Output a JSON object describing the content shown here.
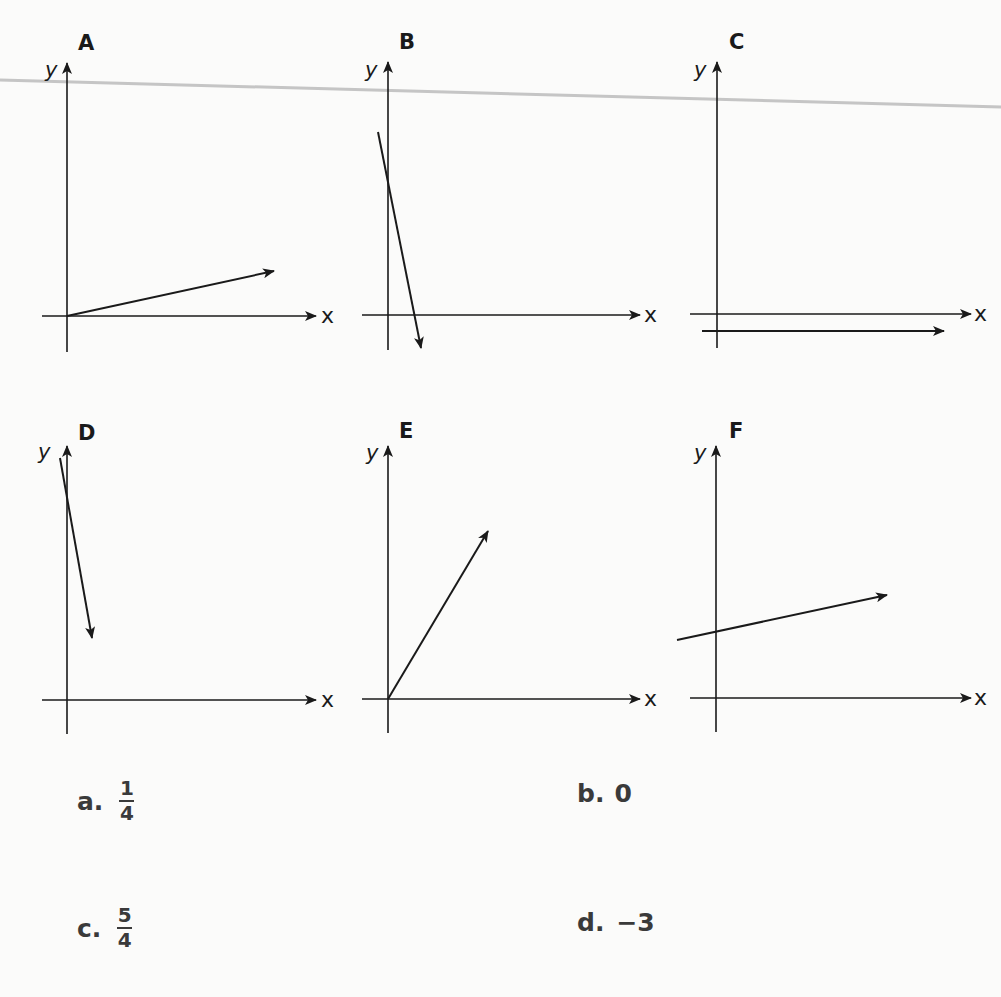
{
  "graphs": [
    {
      "label": "A",
      "x_axis": "x",
      "y_axis": "y",
      "line": "increasing from origin, shallow positive slope"
    },
    {
      "label": "B",
      "x_axis": "x",
      "y_axis": "y",
      "line": "steep negative slope, crossing y-axis above origin"
    },
    {
      "label": "C",
      "x_axis": "x",
      "y_axis": "y",
      "line": "horizontal line slightly below x-axis"
    },
    {
      "label": "D",
      "x_axis": "x",
      "y_axis": "y",
      "line": "steep negative slope near top of y-axis"
    },
    {
      "label": "E",
      "x_axis": "x",
      "y_axis": "y",
      "line": "increasing from origin, positive slope"
    },
    {
      "label": "F",
      "x_axis": "x",
      "y_axis": "y",
      "line": "shallow positive slope with positive y-intercept"
    }
  ],
  "options": {
    "a": {
      "letter": "a.",
      "numerator": "1",
      "denominator": "4"
    },
    "b": {
      "letter": "b.",
      "value": "0"
    },
    "c": {
      "letter": "c.",
      "numerator": "5",
      "denominator": "4"
    },
    "d": {
      "letter": "d.",
      "value": "−3"
    }
  }
}
